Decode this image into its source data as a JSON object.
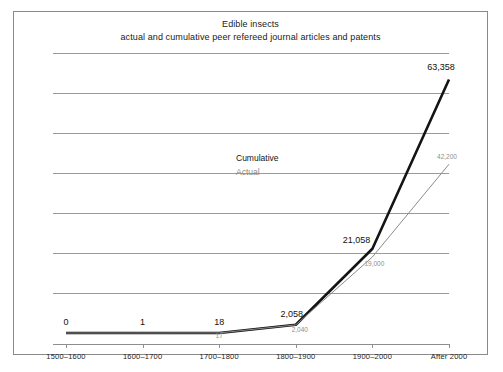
{
  "chart_data": {
    "type": "line",
    "title": "Edible insects",
    "subtitle": "actual and cumulative peer refereed journal articles and patents",
    "xlabel": "",
    "ylabel": "",
    "grid": true,
    "gridlines": 7,
    "legend_position": "inside-center",
    "categories": [
      "1500–1600",
      "1600–1700",
      "1700–1800",
      "1800–1900",
      "1900–2000",
      "After 2000"
    ],
    "ylim": [
      0,
      70000
    ],
    "series": [
      {
        "name": "Cumulative",
        "color": "#141414",
        "width": 2.6,
        "values": [
          0,
          1,
          18,
          2058,
          21058,
          63358
        ],
        "labels": [
          "0",
          "1",
          "18",
          "2,058",
          "21,058",
          "63,358"
        ]
      },
      {
        "name": "Actual",
        "color": "#8b8b8b",
        "width": 1,
        "values": [
          0,
          1,
          17,
          2040,
          19000,
          42200
        ],
        "labels": [
          "0",
          "1",
          "17",
          "2,040",
          "19,000",
          "42,200"
        ]
      }
    ]
  },
  "frame": {
    "border_color": "#8a8a8a",
    "background": "#ffffff",
    "gridline_color": "#9a9a9a",
    "axis_color": "#8e8e8e"
  }
}
